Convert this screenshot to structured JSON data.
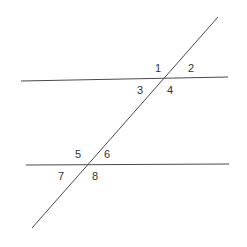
{
  "diagram": {
    "colors": {
      "line": "#4a4a4a",
      "label": "#333333",
      "background": "#ffffff"
    },
    "lines": {
      "upper_parallel": {
        "x1": 21,
        "y1": 81,
        "x2": 228,
        "y2": 77
      },
      "lower_parallel": {
        "x1": 26,
        "y1": 165,
        "x2": 229,
        "y2": 164
      },
      "transversal": {
        "x1": 218,
        "y1": 17,
        "x2": 32,
        "y2": 228
      }
    },
    "labels": [
      {
        "text": "1",
        "x": 155,
        "y": 72
      },
      {
        "text": "2",
        "x": 188,
        "y": 72
      },
      {
        "text": "3",
        "x": 137,
        "y": 94
      },
      {
        "text": "4",
        "x": 167,
        "y": 94
      },
      {
        "text": "5",
        "x": 75,
        "y": 158
      },
      {
        "text": "6",
        "x": 104,
        "y": 158
      },
      {
        "text": "7",
        "x": 58,
        "y": 180
      },
      {
        "text": "8",
        "x": 92,
        "y": 180
      }
    ]
  }
}
